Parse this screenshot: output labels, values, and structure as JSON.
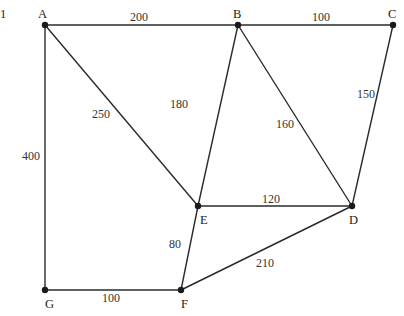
{
  "figure_number": "1",
  "graph": {
    "type": "weighted-undirected-graph",
    "nodes": [
      {
        "id": "A",
        "x": 45,
        "y": 25,
        "lx": 38,
        "ly": 18
      },
      {
        "id": "B",
        "x": 238,
        "y": 25,
        "lx": 233,
        "ly": 18
      },
      {
        "id": "C",
        "x": 393,
        "y": 25,
        "lx": 388,
        "ly": 18
      },
      {
        "id": "D",
        "x": 352,
        "y": 206,
        "lx": 349,
        "ly": 224
      },
      {
        "id": "E",
        "x": 198,
        "y": 206,
        "lx": 200,
        "ly": 224
      },
      {
        "id": "F",
        "x": 181,
        "y": 290,
        "lx": 181,
        "ly": 308
      },
      {
        "id": "G",
        "x": 45,
        "y": 290,
        "lx": 45,
        "ly": 308
      }
    ],
    "edges": [
      {
        "from": "A",
        "to": "B",
        "weight": "200",
        "lx": 130,
        "ly": 21
      },
      {
        "from": "B",
        "to": "C",
        "weight": "100",
        "lx": 312,
        "ly": 21
      },
      {
        "from": "A",
        "to": "G",
        "weight": "400",
        "lx": 22,
        "ly": 160
      },
      {
        "from": "A",
        "to": "E",
        "weight": "250",
        "lx": 92,
        "ly": 118
      },
      {
        "from": "B",
        "to": "E",
        "weight": "180",
        "lx": 170,
        "ly": 108
      },
      {
        "from": "B",
        "to": "D",
        "weight": "160",
        "lx": 276,
        "ly": 128
      },
      {
        "from": "C",
        "to": "D",
        "weight": "150",
        "lx": 357,
        "ly": 98
      },
      {
        "from": "E",
        "to": "D",
        "weight": "120",
        "lx": 262,
        "ly": 203
      },
      {
        "from": "E",
        "to": "F",
        "weight": "80",
        "lx": 169,
        "ly": 248
      },
      {
        "from": "F",
        "to": "D",
        "weight": "210",
        "lx": 256,
        "ly": 267
      },
      {
        "from": "G",
        "to": "F",
        "weight": "100",
        "lx": 102,
        "ly": 302
      }
    ]
  }
}
